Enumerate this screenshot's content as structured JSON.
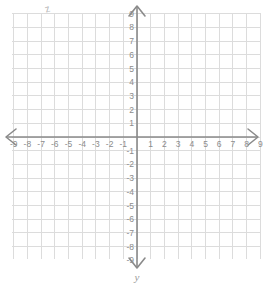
{
  "figure": {
    "kind": "cartesian-coordinate-plane",
    "width": 264,
    "height": 289,
    "background_color": "#ffffff"
  },
  "grid": {
    "line_color": "#dcdcdc",
    "cell_size_px": 13.7,
    "visible": true,
    "x_min_px": 12,
    "x_max_px": 260,
    "y_min_px": 13,
    "y_max_px": 259
  },
  "axes": {
    "color": "#8a8a8a",
    "origin_x_px": 137,
    "origin_y_px": 137,
    "arrowheads": [
      "left",
      "right",
      "up",
      "down"
    ],
    "x_axis_name": "",
    "y_axis_name": "y"
  },
  "chart_data": {
    "type": "scatter",
    "title": "",
    "xlabel": "",
    "ylabel": "y",
    "xlim": [
      -9,
      9
    ],
    "ylim": [
      -9,
      9
    ],
    "grid": true,
    "legend": null,
    "series": [],
    "x_ticks": [
      -9,
      -8,
      -7,
      -6,
      -5,
      -4,
      -3,
      -2,
      -1,
      1,
      2,
      3,
      4,
      5,
      6,
      7,
      8,
      9
    ],
    "y_ticks": [
      9,
      8,
      7,
      6,
      5,
      4,
      3,
      2,
      1,
      -1,
      -2,
      -3,
      -4,
      -5,
      -6,
      -7,
      -8,
      -9
    ],
    "x_tick_labels": [
      "-9",
      "-8",
      "-7",
      "-6",
      "-5",
      "-4",
      "-3",
      "-2",
      "-1",
      "1",
      "2",
      "3",
      "4",
      "5",
      "6",
      "7",
      "8",
      "9"
    ],
    "y_tick_labels": [
      "9",
      "8",
      "7",
      "6",
      "5",
      "4",
      "3",
      "2",
      "1",
      "-1",
      "-2",
      "-3",
      "-4",
      "-5",
      "-6",
      "-7",
      "-8",
      "-9"
    ],
    "tick_label_color": "#8c8c8c",
    "annotations": [
      {
        "text": "z",
        "x_px": 45,
        "y_px": 4,
        "note": "faint stray scan artifact near top-left"
      }
    ]
  }
}
